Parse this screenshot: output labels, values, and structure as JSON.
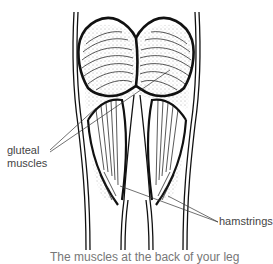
{
  "figure": {
    "labels": {
      "gluteal": "gluteal muscles",
      "hamstrings": "hamstrings"
    },
    "caption": "The muscles at the back of your leg",
    "colors": {
      "line": "#111111",
      "label_text": "#444444",
      "background": "#ffffff"
    }
  }
}
